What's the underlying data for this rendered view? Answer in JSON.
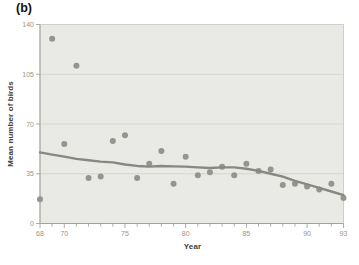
{
  "chart_data": {
    "type": "scatter",
    "panel_label": "(b)",
    "title": "",
    "xlabel": "Year",
    "ylabel": "Mean number of birds",
    "xlim": [
      68,
      93
    ],
    "ylim": [
      0,
      140
    ],
    "x_major_ticks": [
      68,
      70,
      75,
      80,
      85,
      90,
      93
    ],
    "x_minor_tick_step": 1,
    "y_ticks": [
      0,
      35,
      70,
      105,
      140
    ],
    "grid": "horizontal gridlines at y ticks",
    "legend": "none",
    "points": [
      [
        68,
        17
      ],
      [
        69,
        130
      ],
      [
        70,
        56
      ],
      [
        71,
        111
      ],
      [
        72,
        32
      ],
      [
        73,
        33
      ],
      [
        74,
        58
      ],
      [
        75,
        62
      ],
      [
        76,
        32
      ],
      [
        77,
        42
      ],
      [
        78,
        51
      ],
      [
        79,
        28
      ],
      [
        80,
        47
      ],
      [
        81,
        34
      ],
      [
        82,
        36
      ],
      [
        83,
        40
      ],
      [
        84,
        34
      ],
      [
        85,
        42
      ],
      [
        86,
        37
      ],
      [
        87,
        38
      ],
      [
        88,
        27
      ],
      [
        89,
        28
      ],
      [
        90,
        26
      ],
      [
        91,
        24
      ],
      [
        92,
        28
      ],
      [
        93,
        18
      ]
    ],
    "series": [
      {
        "name": "smoothed-trend-line",
        "type": "line",
        "points": [
          [
            68,
            50
          ],
          [
            69,
            48.5
          ],
          [
            70,
            47
          ],
          [
            71,
            45.5
          ],
          [
            72,
            44.5
          ],
          [
            73,
            43.5
          ],
          [
            74,
            43
          ],
          [
            75,
            41.5
          ],
          [
            76,
            40.5
          ],
          [
            77,
            40
          ],
          [
            78,
            40.5
          ],
          [
            79,
            40.2
          ],
          [
            80,
            40
          ],
          [
            81,
            39.5
          ],
          [
            82,
            39
          ],
          [
            83,
            39.5
          ],
          [
            84,
            39.5
          ],
          [
            85,
            38.5
          ],
          [
            86,
            37
          ],
          [
            87,
            35
          ],
          [
            88,
            33
          ],
          [
            89,
            30
          ],
          [
            90,
            27.5
          ],
          [
            91,
            25
          ],
          [
            92,
            22.5
          ],
          [
            93,
            20
          ]
        ]
      }
    ],
    "colors": {
      "plot_background": "#e9e9e6",
      "gridline": "#cfcfca",
      "plot_border": "#c6c6c1",
      "axis_line": "#a3a39e",
      "tick_mark": "#a3a39e",
      "tick_label": "#9e9484",
      "point_fill": "#95958f",
      "trend_line": "#888882",
      "axis_title": "#3e3e3a",
      "panel_label": "#111111"
    }
  }
}
